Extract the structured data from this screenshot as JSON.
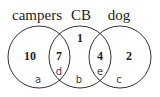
{
  "diagram": {
    "type": "venn",
    "sets": [
      {
        "label": "campers"
      },
      {
        "label": "CB"
      },
      {
        "label": "dog"
      }
    ],
    "regions": {
      "campers_only": "10",
      "campers_cb": "7",
      "cb_only": "1",
      "cb_dog": "4",
      "dog_only": "2"
    },
    "region_letters": {
      "a": "a",
      "b": "b",
      "c": "c",
      "d": "d",
      "e": "e"
    }
  }
}
